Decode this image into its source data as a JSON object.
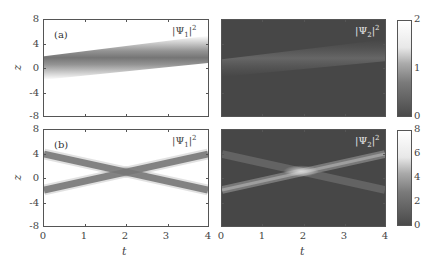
{
  "chart_data": [
    {
      "type": "heatmap",
      "panel": "(a)",
      "field": "|Ψ1|^2",
      "xlabel": "t",
      "ylabel": "z",
      "xlim": [
        0,
        4
      ],
      "ylim": [
        -8,
        8
      ],
      "yticks": [
        8,
        4,
        0,
        -4,
        -8
      ],
      "colormap": "white-to-gray (dark beam on white)",
      "beams": [
        {
          "z_at_t0": 0,
          "z_at_t4": 3.5,
          "width": 1.5
        }
      ]
    },
    {
      "type": "heatmap",
      "panel": "(a)",
      "field": "|Ψ2|^2",
      "xlabel": "t",
      "ylabel": "z",
      "xlim": [
        0,
        4
      ],
      "ylim": [
        -8,
        8
      ],
      "colorbar": {
        "min": 0,
        "max": 2,
        "ticks": [
          0,
          1,
          2
        ]
      },
      "beams": [
        {
          "z_at_t0": 0,
          "z_at_t4": 3.5,
          "width": 1.5,
          "intensity": "faint"
        }
      ]
    },
    {
      "type": "heatmap",
      "panel": "(b)",
      "field": "|Ψ1|^2",
      "xlabel": "t",
      "ylabel": "z",
      "xlim": [
        0,
        4
      ],
      "ylim": [
        -8,
        8
      ],
      "xticks": [
        0,
        1,
        2,
        3,
        4
      ],
      "yticks": [
        8,
        4,
        0,
        -4,
        -8
      ],
      "beams": [
        {
          "z_at_t0": 4,
          "z_at_t4": -2,
          "width": 1.0
        },
        {
          "z_at_t0": -2,
          "z_at_t4": 4,
          "width": 1.0
        }
      ],
      "crossing": {
        "t": 2,
        "z": 1
      }
    },
    {
      "type": "heatmap",
      "panel": "(b)",
      "field": "|Ψ2|^2",
      "xlabel": "t",
      "ylabel": "z",
      "xlim": [
        0,
        4
      ],
      "ylim": [
        -8,
        8
      ],
      "xticks": [
        0,
        1,
        2,
        3,
        4
      ],
      "colorbar": {
        "min": 0,
        "max": 8,
        "ticks": [
          0,
          2,
          4,
          6,
          8
        ]
      },
      "beams": [
        {
          "z_at_t0": 4,
          "z_at_t4": -2,
          "width": 1.0
        },
        {
          "z_at_t0": -2,
          "z_at_t4": 4,
          "width": 1.0
        }
      ],
      "crossing": {
        "t": 2,
        "z": 1
      }
    }
  ],
  "labels": {
    "panel_a": "(a)",
    "panel_b": "(b)",
    "psi": "Ψ",
    "sub1": "1",
    "sub2": "2",
    "sup2": "2",
    "bar": "|",
    "xaxis": "t",
    "yaxis": "z"
  },
  "yticks": [
    "8",
    "4",
    "0",
    "-4",
    "-8"
  ],
  "xticks": [
    "0",
    "1",
    "2",
    "3",
    "4"
  ],
  "cbar_top_ticks": [
    "2",
    "1",
    "0"
  ],
  "cbar_bottom_ticks": [
    "8",
    "6",
    "4",
    "2",
    "0"
  ],
  "colors": {
    "dark_bg": "#474747",
    "beam_gray": "#6a6a6a",
    "frame": "#555555"
  }
}
